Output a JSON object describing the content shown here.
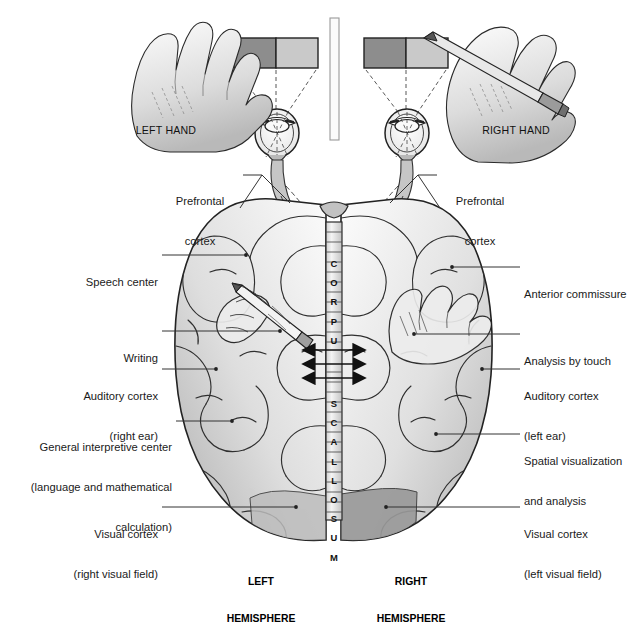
{
  "figure": {
    "type": "anatomical-diagram"
  },
  "top": {
    "left_hand_caption": "LEFT HAND",
    "right_hand_caption": "RIGHT HAND",
    "divider_name": "central-screen-divider",
    "stimulus_cards": [
      {
        "name": "left-visual-field-card",
        "left_half_color": "#8d8d8d",
        "right_half_color": "#c9c9c9"
      },
      {
        "name": "right-visual-field-card",
        "left_half_color": "#8d8d8d",
        "right_half_color": "#c9c9c9"
      }
    ],
    "eyes": [
      "left-eye",
      "right-eye"
    ]
  },
  "labels_left": [
    {
      "id": "prefrontal-cortex-left",
      "lines": [
        "Prefrontal",
        "cortex"
      ],
      "x": 160,
      "y": 168,
      "w": 80,
      "align": "center"
    },
    {
      "id": "speech-center",
      "lines": [
        "Speech center"
      ],
      "x": 60,
      "y": 249,
      "w": 98,
      "align": "right"
    },
    {
      "id": "writing",
      "lines": [
        "Writing"
      ],
      "x": 60,
      "y": 325,
      "w": 98,
      "align": "right"
    },
    {
      "id": "auditory-cortex-right-ear",
      "lines": [
        "Auditory cortex",
        "(right ear)"
      ],
      "x": 42,
      "y": 363,
      "w": 116,
      "align": "right"
    },
    {
      "id": "general-interpretive-center",
      "lines": [
        "General interpretive center",
        "(language and mathematical",
        "calculation)"
      ],
      "x": 10,
      "y": 414,
      "w": 162,
      "align": "right"
    },
    {
      "id": "visual-cortex-right-visual-field",
      "lines": [
        "Visual cortex",
        "(right visual field)"
      ],
      "x": 48,
      "y": 501,
      "w": 110,
      "align": "right"
    }
  ],
  "labels_right": [
    {
      "id": "prefrontal-cortex-right",
      "lines": [
        "Prefrontal",
        "cortex"
      ],
      "x": 440,
      "y": 168,
      "w": 80,
      "align": "center"
    },
    {
      "id": "anterior-commissure",
      "lines": [
        "Anterior commissure"
      ],
      "x": 524,
      "y": 261,
      "w": 112,
      "align": "left"
    },
    {
      "id": "analysis-by-touch",
      "lines": [
        "Analysis by touch"
      ],
      "x": 524,
      "y": 328,
      "w": 112,
      "align": "left"
    },
    {
      "id": "auditory-cortex-left-ear",
      "lines": [
        "Auditory cortex",
        "(left ear)"
      ],
      "x": 524,
      "y": 363,
      "w": 112,
      "align": "left"
    },
    {
      "id": "spatial-visualization-and-analysis",
      "lines": [
        "Spatial visualization",
        "and analysis"
      ],
      "x": 524,
      "y": 428,
      "w": 112,
      "align": "left"
    },
    {
      "id": "visual-cortex-left-visual-field",
      "lines": [
        "Visual cortex",
        "(left visual field)"
      ],
      "x": 524,
      "y": 501,
      "w": 112,
      "align": "left"
    }
  ],
  "corpus_callosum": {
    "text": "CORPUS CALLOSUM",
    "letters": [
      "C",
      "O",
      "R",
      "P",
      "U",
      "S",
      "C",
      "A",
      "L",
      "L",
      "O",
      "S",
      "U",
      "M"
    ],
    "arrow_count": 3
  },
  "hemispheres": [
    {
      "id": "left-hemisphere-caption",
      "lines": [
        "LEFT",
        "HEMISPHERE"
      ],
      "x": 214,
      "y": 551
    },
    {
      "id": "right-hemisphere-caption",
      "lines": [
        "RIGHT",
        "HEMISPHERE"
      ],
      "x": 364,
      "y": 551
    }
  ],
  "overlays": {
    "left_hemisphere_overlay": "hand-with-pencil-writing",
    "right_hemisphere_overlay": "hand-open-touch"
  },
  "colors": {
    "brain_light": "#f2f2f2",
    "brain_mid": "#d5d5d5",
    "brain_dark": "#a8a8a8",
    "occipital_shade": "#9a9a9a",
    "outline": "#2b2b2b",
    "leader": "#333333",
    "skin_light": "#efefef",
    "skin_mid": "#cfcfcf"
  }
}
